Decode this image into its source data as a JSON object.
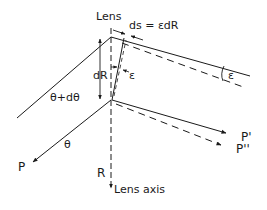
{
  "diagram": {
    "labels": {
      "lens": "Lens",
      "ds_eq": "ds = εdR",
      "epsilon_inner": "ε",
      "epsilon_outer": "ε",
      "dR": "dR",
      "theta_plus_dtheta": "θ+dθ",
      "theta": "θ",
      "P": "P",
      "P_prime": "P'",
      "P_double_prime": "P''",
      "R": "R",
      "lens_axis": "Lens axis"
    },
    "colors": {
      "stroke": "#1a1a1a",
      "background": "#ffffff"
    }
  }
}
